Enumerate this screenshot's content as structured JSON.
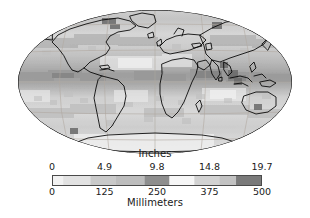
{
  "figure": {
    "type": "map-with-colorbar",
    "projection": "mollweide",
    "background_color": "#ffffff"
  },
  "map": {
    "name": "global-precipitation-map",
    "coastline_color": "#000000",
    "graticule_color": "#b0a8a0",
    "ocean_base_color": "#d8d8d8",
    "land_base_color": "#cfcfcf",
    "graticule": {
      "meridian_interval_deg": 60,
      "parallel_interval_deg": 30
    }
  },
  "colorbar": {
    "name": "precipitation-colorbar",
    "orientation": "horizontal",
    "top_label": "Inches",
    "bottom_label": "Millimeters",
    "top_ticks": [
      "0",
      "4.9",
      "9.8",
      "14.8",
      "19.7"
    ],
    "bottom_ticks": [
      "0",
      "125",
      "250",
      "375",
      "500"
    ],
    "range_mm": [
      0,
      500
    ],
    "range_in": [
      0,
      19.7
    ],
    "border_color": "#4a4a4a",
    "bands": [
      {
        "start_pct": 0,
        "end_pct": 5,
        "color": "#f2f2f2"
      },
      {
        "start_pct": 5,
        "end_pct": 18,
        "color": "#e2e2e2"
      },
      {
        "start_pct": 18,
        "end_pct": 30,
        "color": "#c9c9c9"
      },
      {
        "start_pct": 30,
        "end_pct": 44,
        "color": "#bdbdbd"
      },
      {
        "start_pct": 44,
        "end_pct": 56,
        "color": "#8e8e8e"
      },
      {
        "start_pct": 56,
        "end_pct": 68,
        "color": "#f6f6f6"
      },
      {
        "start_pct": 68,
        "end_pct": 80,
        "color": "#d2d2d2"
      },
      {
        "start_pct": 80,
        "end_pct": 88,
        "color": "#c2c2c2"
      },
      {
        "start_pct": 88,
        "end_pct": 100,
        "color": "#7a7a7a"
      }
    ]
  },
  "chart_data": {
    "type": "heatmap",
    "title": "",
    "subtitle": "",
    "xlabel": "",
    "ylabel": "",
    "legend_position": "bottom",
    "grid": true,
    "projection": "mollweide",
    "colorbar_primary_label": "Millimeters",
    "colorbar_secondary_label": "Inches",
    "colorbar_primary_ticks": [
      0,
      125,
      250,
      375,
      500
    ],
    "colorbar_secondary_ticks": [
      0,
      4.9,
      9.8,
      14.8,
      19.7
    ],
    "colormap": "grayscale",
    "value_range_mm": [
      0,
      500
    ],
    "annotations": []
  }
}
